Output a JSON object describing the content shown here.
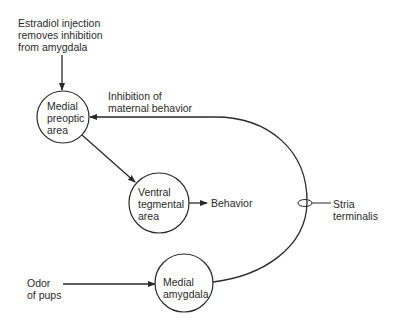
{
  "diagram": {
    "nodes": {
      "mpoa": {
        "lines": [
          "Medial",
          "preoptic",
          "area"
        ]
      },
      "vta": {
        "lines": [
          "Ventral",
          "tegmental",
          "area"
        ]
      },
      "amygdala": {
        "lines": [
          "Medial",
          "amygdala"
        ]
      }
    },
    "labels": {
      "estradiol": [
        "Estradiol injection",
        "removes inhibition",
        "from amygdala"
      ],
      "inhibition": [
        "Inhibition of",
        "maternal behavior"
      ],
      "behavior": "Behavior",
      "stria": [
        "Stria",
        "terminalis"
      ],
      "odor": [
        "Odor",
        "of pups"
      ]
    },
    "colors": {
      "stroke": "#2a2a2a",
      "background": "#ffffff"
    }
  }
}
